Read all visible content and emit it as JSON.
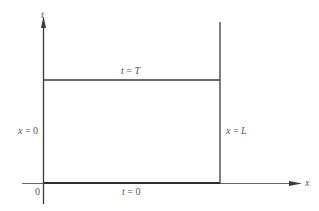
{
  "diagram": {
    "axes": {
      "vertical_label": "t",
      "horizontal_label": "x",
      "origin_label": "0"
    },
    "boundaries": {
      "top": {
        "var": "t",
        "eq": " = ",
        "val": "T"
      },
      "bottom": {
        "var": "t",
        "eq": " = ",
        "val": "0"
      },
      "left": {
        "var": "x",
        "eq": " = ",
        "val": "0"
      },
      "right": {
        "var": "x",
        "eq": " = ",
        "val": "L"
      }
    },
    "colors": {
      "line": "#3a3a3a",
      "text": "#555555"
    }
  }
}
